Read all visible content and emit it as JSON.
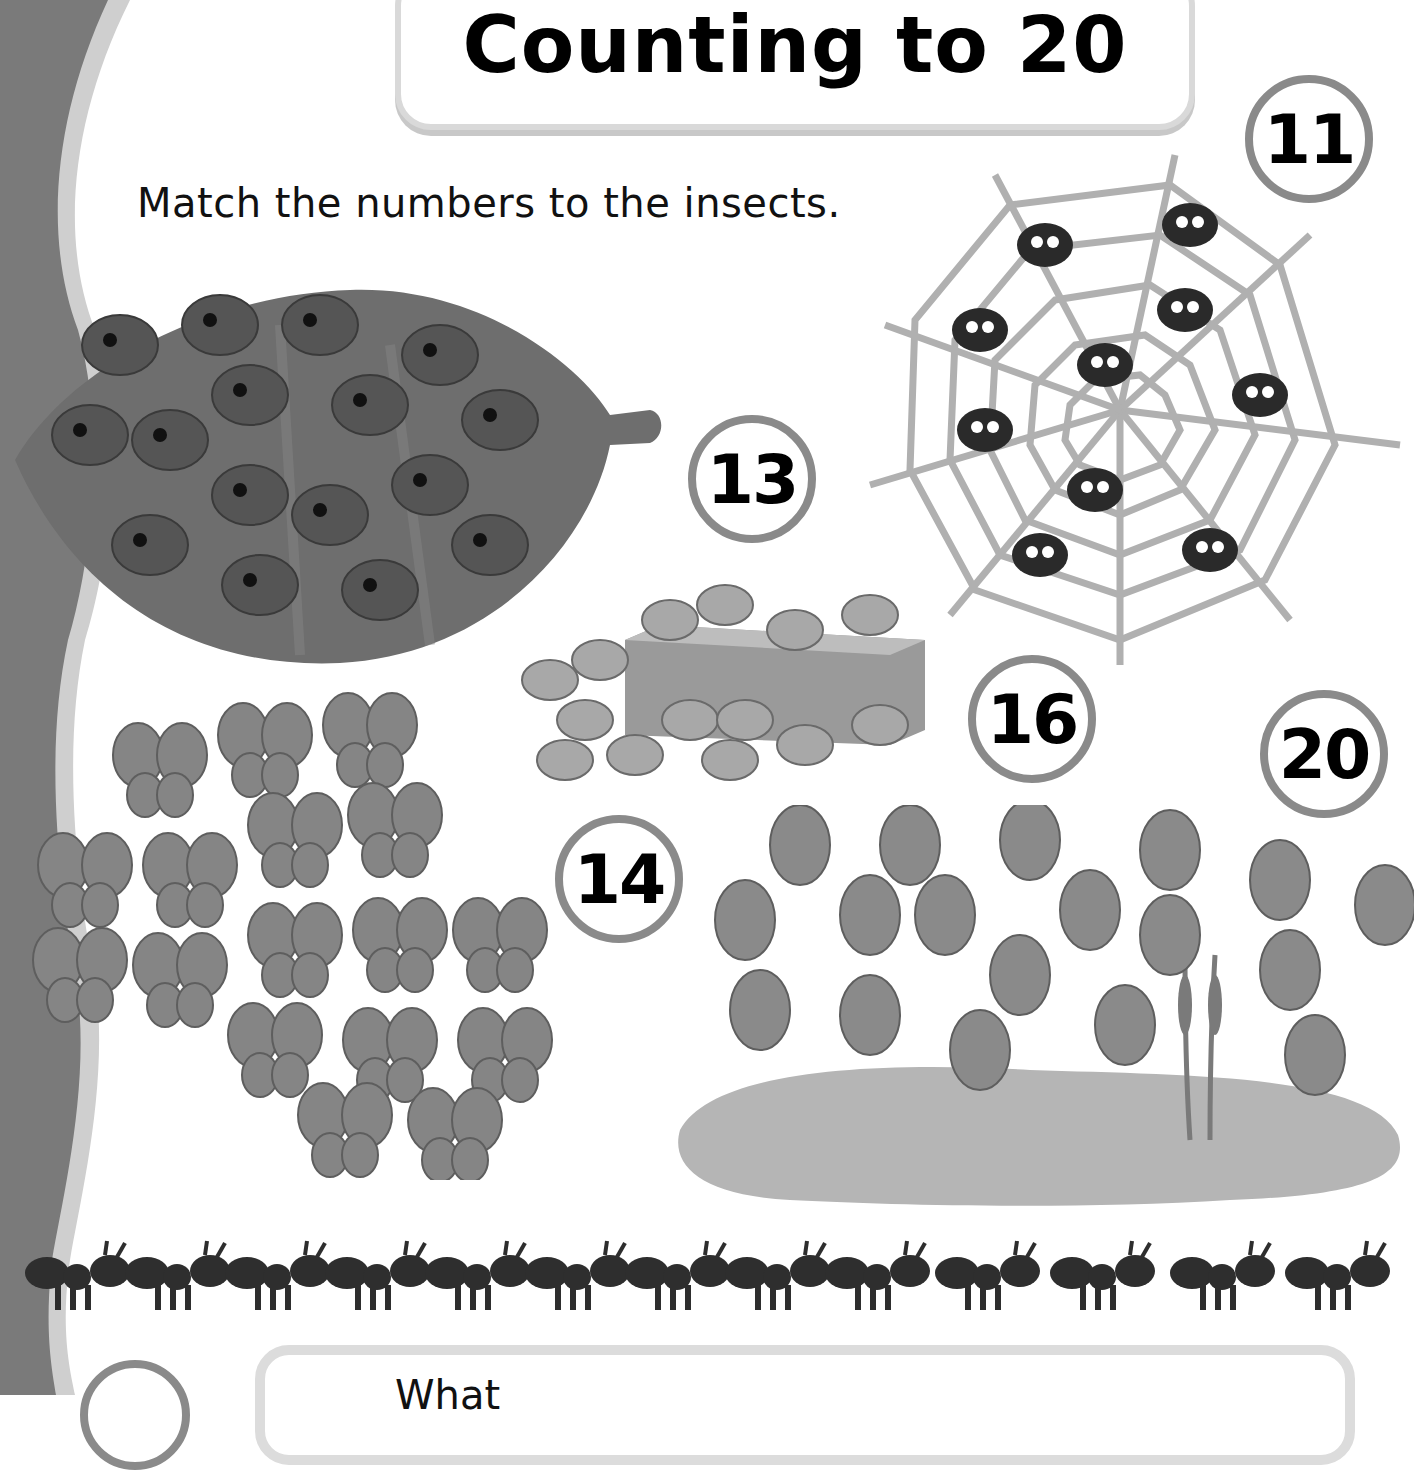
{
  "page": {
    "title": "Counting to 20",
    "instruction": "Match the numbers to the insects.",
    "bottom_prompt_partial": "What"
  },
  "number_circles": [
    {
      "value": "11",
      "x": 1245,
      "y": 75
    },
    {
      "value": "13",
      "x": 688,
      "y": 415
    },
    {
      "value": "16",
      "x": 968,
      "y": 655
    },
    {
      "value": "20",
      "x": 1260,
      "y": 690
    },
    {
      "value": "14",
      "x": 555,
      "y": 815
    }
  ],
  "insect_groups": [
    {
      "name": "ladybugs",
      "label": "ladybirds on a leaf",
      "count": 16
    },
    {
      "name": "spiders",
      "label": "spiders on a web",
      "count": 11
    },
    {
      "name": "crabs",
      "label": "crabs around a box",
      "count": 16
    },
    {
      "name": "butterflies",
      "label": "butterflies",
      "count": 16
    },
    {
      "name": "dragonflies",
      "label": "dragonflies over a pond",
      "count": 20
    },
    {
      "name": "ants",
      "label": "row of ants",
      "count": 13
    }
  ],
  "colors": {
    "sidebar": "#7a7a7a",
    "sidebar_stripe": "#cfcfcf",
    "circle_border": "#8a8a8a",
    "box_border": "#d9d9d9",
    "text": "#000000"
  }
}
